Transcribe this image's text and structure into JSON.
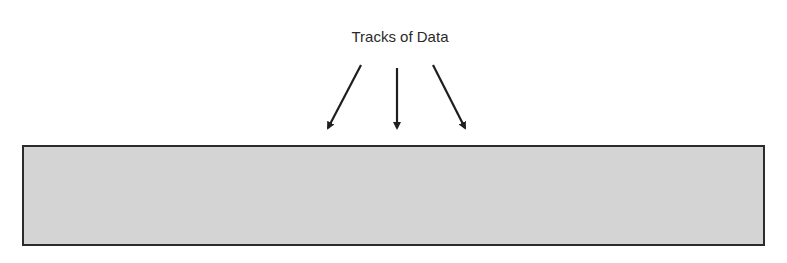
{
  "diagram": {
    "label": "Tracks of Data",
    "arrows": [
      {
        "name": "left",
        "x1": 361,
        "y1": 65,
        "x2": 328,
        "y2": 128
      },
      {
        "name": "middle",
        "x1": 397,
        "y1": 68,
        "x2": 397,
        "y2": 128
      },
      {
        "name": "right",
        "x1": 433,
        "y1": 65,
        "x2": 465,
        "y2": 128
      }
    ],
    "box": {
      "fill": "#d4d4d4",
      "stroke": "#2b2b2b"
    }
  }
}
